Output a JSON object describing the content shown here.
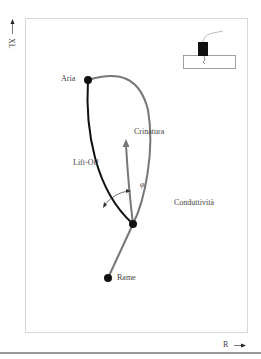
{
  "axes": {
    "y_label": "XL",
    "x_label": "R"
  },
  "points": {
    "aria": "Aria",
    "crinatura": "Crinatura",
    "lift_off": "Lift-Off",
    "phi": "φ",
    "conduttivita": "Conduttività",
    "rame": "Rame"
  },
  "colors": {
    "frame": "#d8d8d8",
    "black_curve": "#111111",
    "gray_curve": "#777777",
    "text": "#444444"
  }
}
